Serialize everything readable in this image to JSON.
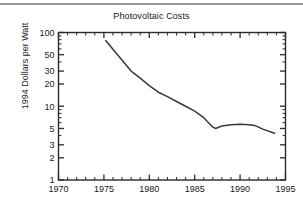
{
  "figure": {
    "title": "Photovoltaic Costs",
    "background_color": "#ffffff",
    "rule_color": "#9a9a9a",
    "axis_color": "#2b2b2b",
    "line_color": "#3a3a3a"
  },
  "chart_data": {
    "type": "line",
    "title": "Photovoltaic Costs",
    "xlabel": "",
    "ylabel": "1994 Dollars per Watt",
    "xlim": [
      1970,
      1995
    ],
    "ylim": [
      1,
      100
    ],
    "yscale": "log",
    "xscale": "linear",
    "grid": false,
    "legend": null,
    "x_major_ticks": [
      1970,
      1975,
      1980,
      1985,
      1990,
      1995
    ],
    "x_major_tick_labels": [
      "1970",
      "1975",
      "1980",
      "1985",
      "1990",
      "1995"
    ],
    "x_minor_tick_step": 1,
    "y_major_ticks": [
      1,
      2,
      3,
      5,
      10,
      20,
      30,
      50,
      100
    ],
    "y_major_tick_labels": [
      "1",
      "2",
      "3",
      "5",
      "10",
      "20",
      "30",
      "50",
      "100"
    ],
    "series": [
      {
        "name": "Photovoltaic module cost",
        "x": [
          1975.2,
          1976.5,
          1978.0,
          1979.0,
          1980.0,
          1981.0,
          1982.0,
          1983.0,
          1984.0,
          1985.0,
          1986.0,
          1987.0,
          1987.3,
          1988.0,
          1989.0,
          1990.0,
          1991.0,
          1991.6,
          1992.5,
          1993.8
        ],
        "y": [
          78,
          50,
          30,
          24,
          19,
          15.5,
          13.5,
          11.6,
          10.0,
          8.6,
          7.0,
          5.2,
          5.0,
          5.4,
          5.6,
          5.7,
          5.6,
          5.5,
          4.9,
          4.3
        ]
      }
    ]
  }
}
